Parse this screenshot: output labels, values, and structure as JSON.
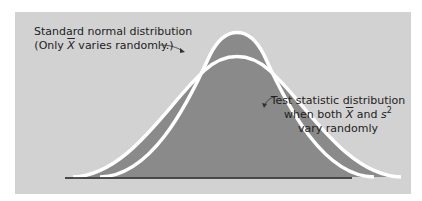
{
  "figure": {
    "type": "diagram",
    "colors": {
      "panel_background": "#d2d2d2",
      "fill": "#8a8a8a",
      "curve_stroke": "#ffffff",
      "baseline": "#1a1a1a",
      "text": "#222222"
    },
    "labels": {
      "standard_normal": {
        "line1": "Standard normal distribution",
        "line2_prefix": "(Only ",
        "line2_symbol": "X",
        "line2_suffix": " varies randomly.)"
      },
      "test_statistic": {
        "line1": "Test statistic distribution",
        "line2_prefix": "when both ",
        "line2_symbol1": "X",
        "line2_mid": " and ",
        "line2_symbol2": "s",
        "line2_sup": "2",
        "line3": "vary randomly"
      }
    }
  }
}
